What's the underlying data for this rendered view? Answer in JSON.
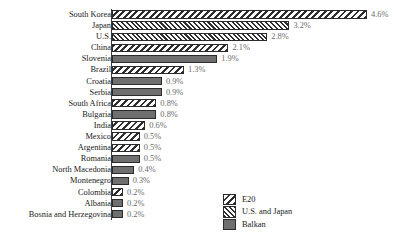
{
  "chart_data": {
    "type": "bar",
    "orientation": "horizontal",
    "title": "",
    "subtitle": "",
    "xlabel": "",
    "ylabel": "",
    "xlim": [
      0,
      4.6
    ],
    "grid": false,
    "legend_position": "bottom-right",
    "value_suffix": "%",
    "categories": [
      "South Korea",
      "Japan",
      "U.S.",
      "China",
      "Slovenia",
      "Brazil",
      "Croatia",
      "Serbia",
      "South Africa",
      "Bulgaria",
      "India",
      "Mexico",
      "Argentina",
      "Romania",
      "North Macedonia",
      "Montenegro",
      "Colombia",
      "Albania",
      "Bosnia and Herzegovina"
    ],
    "values": [
      4.6,
      3.2,
      2.8,
      2.1,
      1.9,
      1.3,
      0.9,
      0.9,
      0.8,
      0.8,
      0.6,
      0.5,
      0.5,
      0.5,
      0.4,
      0.3,
      0.2,
      0.2,
      0.2
    ],
    "value_labels": [
      "4.6%",
      "3.2%",
      "2.8%",
      "2.1%",
      "1.9%",
      "1.3%",
      "0.9%",
      "0.9%",
      "0.8%",
      "0.8%",
      "0.6%",
      "0.5%",
      "0.5%",
      "0.5%",
      "0.4%",
      "0.3%",
      "0.2%",
      "0.2%",
      "0.2%"
    ],
    "groups": [
      "E20",
      "U.S. and Japan",
      "U.S. and Japan",
      "E20",
      "Balkan",
      "E20",
      "Balkan",
      "Balkan",
      "E20",
      "Balkan",
      "E20",
      "E20",
      "E20",
      "Balkan",
      "Balkan",
      "Balkan",
      "E20",
      "Balkan",
      "Balkan"
    ],
    "bars": [
      {
        "category": "South Korea",
        "value": 4.6,
        "label": "4.6%",
        "group": "E20"
      },
      {
        "category": "Japan",
        "value": 3.2,
        "label": "3.2%",
        "group": "U.S. and Japan"
      },
      {
        "category": "U.S.",
        "value": 2.8,
        "label": "2.8%",
        "group": "U.S. and Japan"
      },
      {
        "category": "China",
        "value": 2.1,
        "label": "2.1%",
        "group": "E20"
      },
      {
        "category": "Slovenia",
        "value": 1.9,
        "label": "1.9%",
        "group": "Balkan"
      },
      {
        "category": "Brazil",
        "value": 1.3,
        "label": "1.3%",
        "group": "E20"
      },
      {
        "category": "Croatia",
        "value": 0.9,
        "label": "0.9%",
        "group": "Balkan"
      },
      {
        "category": "Serbia",
        "value": 0.9,
        "label": "0.9%",
        "group": "Balkan"
      },
      {
        "category": "South Africa",
        "value": 0.8,
        "label": "0.8%",
        "group": "E20"
      },
      {
        "category": "Bulgaria",
        "value": 0.8,
        "label": "0.8%",
        "group": "Balkan"
      },
      {
        "category": "India",
        "value": 0.6,
        "label": "0.6%",
        "group": "E20"
      },
      {
        "category": "Mexico",
        "value": 0.5,
        "label": "0.5%",
        "group": "E20"
      },
      {
        "category": "Argentina",
        "value": 0.5,
        "label": "0.5%",
        "group": "E20"
      },
      {
        "category": "Romania",
        "value": 0.5,
        "label": "0.5%",
        "group": "Balkan"
      },
      {
        "category": "North Macedonia",
        "value": 0.4,
        "label": "0.4%",
        "group": "Balkan"
      },
      {
        "category": "Montenegro",
        "value": 0.3,
        "label": "0.3%",
        "group": "Balkan"
      },
      {
        "category": "Colombia",
        "value": 0.2,
        "label": "0.2%",
        "group": "E20"
      },
      {
        "category": "Albania",
        "value": 0.2,
        "label": "0.2%",
        "group": "Balkan"
      },
      {
        "category": "Bosnia and Herzegovina",
        "value": 0.2,
        "label": "0.2%",
        "group": "Balkan"
      }
    ],
    "legend": [
      {
        "label": "E20",
        "pattern": "backslash-hatch"
      },
      {
        "label": "U.S. and Japan",
        "pattern": "forward-slash-hatch"
      },
      {
        "label": "Balkan",
        "pattern": "solid-gray"
      }
    ],
    "colors": {
      "hatch_line": "#2e2e2e",
      "hatch_background": "#ffffff",
      "balkan_fill": "#6f6f6f",
      "bar_outline": "#2b2b2b",
      "category_text": "#1a1a1a",
      "value_text": "#6b6b6b",
      "axis": "#3a3a3a",
      "background": "#ffffff"
    }
  }
}
